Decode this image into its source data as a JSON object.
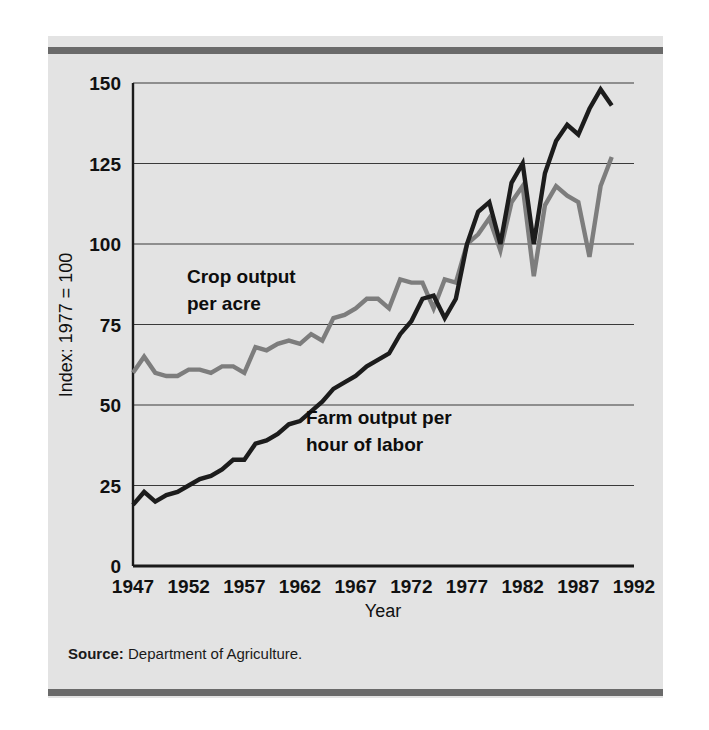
{
  "figure": {
    "source_prefix": "Source:",
    "source_text": "Department of Agriculture.",
    "panel_color": "#e3e3e3",
    "rule_color": "#6a6a6a"
  },
  "chart_data": {
    "type": "line",
    "title": "",
    "xlabel": "Year",
    "ylabel": "Index: 1977 = 100",
    "xlim": [
      1947,
      1992
    ],
    "ylim": [
      0,
      150
    ],
    "xticks": [
      1947,
      1952,
      1957,
      1962,
      1967,
      1972,
      1977,
      1982,
      1987,
      1992
    ],
    "yticks": [
      0,
      25,
      50,
      75,
      100,
      125,
      150
    ],
    "grid": "horizontal",
    "legend": "inline-annotations",
    "x": [
      1947,
      1948,
      1949,
      1950,
      1951,
      1952,
      1953,
      1954,
      1955,
      1956,
      1957,
      1958,
      1959,
      1960,
      1961,
      1962,
      1963,
      1964,
      1965,
      1966,
      1967,
      1968,
      1969,
      1970,
      1971,
      1972,
      1973,
      1974,
      1975,
      1976,
      1977,
      1978,
      1979,
      1980,
      1981,
      1982,
      1983,
      1984,
      1985,
      1986,
      1987,
      1988,
      1989,
      1990
    ],
    "series": [
      {
        "name": "Crop output per acre",
        "color": "#7d7d7d",
        "label_line1": "Crop output",
        "label_line2": "per acre",
        "values": [
          60,
          65,
          60,
          59,
          59,
          61,
          61,
          60,
          62,
          62,
          60,
          68,
          67,
          69,
          70,
          69,
          72,
          70,
          77,
          78,
          80,
          83,
          83,
          80,
          89,
          88,
          88,
          80,
          89,
          88,
          100,
          103,
          108,
          98,
          113,
          118,
          90,
          112,
          118,
          115,
          113,
          96,
          118,
          127
        ]
      },
      {
        "name": "Farm output per hour of labor",
        "color": "#1c1c1c",
        "label_line1": "Farm output per",
        "label_line2": "hour of labor",
        "values": [
          19,
          23,
          20,
          22,
          23,
          25,
          27,
          28,
          30,
          33,
          33,
          38,
          39,
          41,
          44,
          45,
          48,
          51,
          55,
          57,
          59,
          62,
          64,
          66,
          72,
          76,
          83,
          84,
          77,
          83,
          100,
          110,
          113,
          100,
          119,
          125,
          100,
          122,
          132,
          137,
          134,
          142,
          148,
          143
        ]
      }
    ]
  }
}
